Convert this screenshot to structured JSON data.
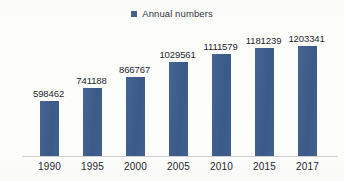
{
  "legend": {
    "marker_name": "legend-color-swatch",
    "label": "Annual numbers",
    "position": "top-center"
  },
  "colors": {
    "series": "#42618f",
    "axis_line": "#cfcfcf",
    "text": "#23272d",
    "background": "#fdfdfc"
  },
  "chart_data": {
    "type": "bar",
    "title": "",
    "subtitle": "",
    "xlabel": "",
    "ylabel": "",
    "categories": [
      "1990",
      "1995",
      "2000",
      "2005",
      "2010",
      "2015",
      "2017"
    ],
    "series": [
      {
        "name": "Annual numbers",
        "color": "#42618f",
        "values": [
          598462,
          741188,
          866767,
          1029561,
          1111579,
          1181239,
          1203341
        ]
      }
    ],
    "values": [
      598462,
      741188,
      866767,
      1029561,
      1111579,
      1181239,
      1203341
    ],
    "data_labels": [
      "598462",
      "741188",
      "866767",
      "1029561",
      "1111579",
      "1181239",
      "1203341"
    ],
    "data_labels_shown": true,
    "ylim": [
      0,
      1290000
    ],
    "grid": false,
    "y_axis_visible": false,
    "x_axis_visible": true,
    "legend": "Annual numbers",
    "legend_position": "top-center"
  }
}
